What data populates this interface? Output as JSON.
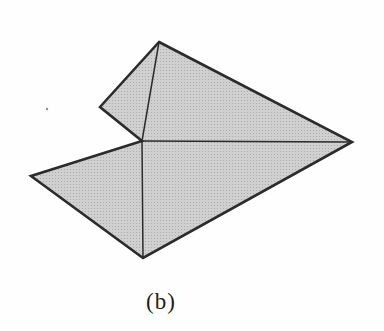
{
  "figure": {
    "label": "(b)"
  },
  "diagram": {
    "background": "#fefefe",
    "fill_base": "#d0d0d0",
    "fill_dot": "#a7a7a7",
    "stroke": "#2b2b2b",
    "outline_width": 2.6,
    "internal_width": 1.5,
    "vertices": {
      "apex": [
        159,
        42
      ],
      "right": [
        352,
        142
      ],
      "bottom": [
        143,
        258
      ],
      "far_left": [
        31,
        176
      ],
      "notch_center": [
        142,
        141
      ],
      "upper_left": [
        100,
        107
      ]
    },
    "outline_order": [
      "apex",
      "right",
      "bottom",
      "far_left",
      "notch_center",
      "upper_left"
    ],
    "internal_segments": [
      [
        "notch_center",
        "apex"
      ],
      [
        "notch_center",
        "right"
      ],
      [
        "notch_center",
        "bottom"
      ]
    ],
    "speck": {
      "x": 47,
      "y": 109,
      "r": 1.2,
      "color": "#8f8b8a"
    }
  }
}
